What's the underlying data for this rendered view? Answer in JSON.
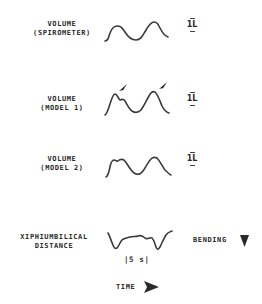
{
  "rows": [
    {
      "label_line1": "VOLUME",
      "label_line2": "(SPIROMETER)",
      "scale": "1L"
    },
    {
      "label_line1": "VOLUME",
      "label_line2": "(MODEL 1)",
      "scale": "1L"
    },
    {
      "label_line1": "VOLUME",
      "label_line2": "(MODEL 2)",
      "scale": "1L"
    },
    {
      "label_line1": "XIPHIUMBILICAL",
      "label_line2": "DISTANCE",
      "annotation": "BENDING",
      "time_scale": "|5 s|"
    }
  ],
  "time_axis": {
    "label": "TIME"
  },
  "icons": {
    "peak_markers": "arrowhead-pointing-down-left",
    "bending": "downward-triangle",
    "time": "rightward-triangle"
  },
  "colors": {
    "ink": "#2a2a2a",
    "background": "#ffffff"
  }
}
